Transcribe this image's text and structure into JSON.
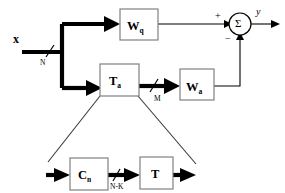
{
  "diagram": {
    "input_signal": {
      "label": "x",
      "dimension": "N"
    },
    "output_signal": {
      "label": "y"
    },
    "blocks": [
      {
        "id": "wq",
        "label": "W",
        "subscript": "q"
      },
      {
        "id": "ta",
        "label": "T",
        "subscript": "a"
      },
      {
        "id": "wa",
        "label": "W",
        "subscript": "a"
      },
      {
        "id": "cn",
        "label": "C",
        "subscript": "n"
      },
      {
        "id": "t",
        "label": "T",
        "subscript": ""
      }
    ],
    "signal_dimensions": [
      {
        "id": "dim-n",
        "label": "N"
      },
      {
        "id": "dim-m",
        "label": "M"
      },
      {
        "id": "dim-nk",
        "label": "N-K"
      }
    ],
    "summing_junction": {
      "symbol": "Σ",
      "plus_sign": "+",
      "minus_sign": "−"
    }
  }
}
